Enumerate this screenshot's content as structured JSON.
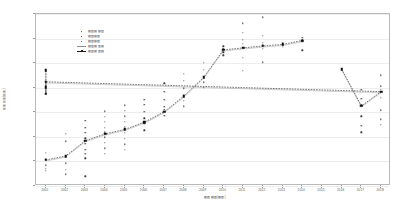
{
  "chart_data": {
    "type": "scatter",
    "title": "",
    "xlabel": "▤▥▤▥(▤▥)",
    "ylabel": "▤▥▤▥(▤▥)",
    "grid": true,
    "legend_position": "upper-left-inside",
    "ylim": [
      5000,
      40000
    ],
    "yticks": [
      5000,
      10000,
      15000,
      20000,
      25000,
      30000,
      35000,
      40000
    ],
    "ytick_labels": [
      "5000",
      "10000",
      "15000",
      "20000",
      "25000",
      "30000",
      "35000",
      "40000"
    ],
    "x": [
      2001,
      2002,
      2003,
      2004,
      2005,
      2006,
      2007,
      2008,
      2009,
      2010,
      2011,
      2012,
      2013,
      2014,
      2015,
      2016,
      2017,
      2018
    ],
    "xtick_labels": [
      "2001",
      "2002",
      "2003",
      "2004",
      "2005",
      "2006",
      "2007",
      "2008",
      "2009",
      "2010",
      "2011",
      "2012",
      "2013",
      "2014",
      "2015",
      "2016",
      "2017",
      "2018"
    ],
    "legend_entries": [
      {
        "label": "▤▥▤ ▤▥",
        "marker": "dot",
        "line": false,
        "color": "#3c3c3c"
      },
      {
        "label": "▤▥▤▥",
        "marker": "dot",
        "line": false,
        "color": "#3c3c3c"
      },
      {
        "label": "▤▥▤▥",
        "marker": "dot",
        "line": false,
        "color": "#3c3c3c"
      },
      {
        "label": "▤▥▤ ▥▤",
        "marker": "dot",
        "line": true,
        "color": "#8a8a8a"
      },
      {
        "label": "▤▥▤ ▥▤",
        "marker": "square",
        "line": true,
        "color": "#1d1d1d"
      }
    ],
    "series": [
      {
        "name": "trend-mean-segment-1",
        "type": "line+marker",
        "marker": "square",
        "color": "#1d1d1d",
        "x": [
          2001,
          2002,
          2003,
          2004,
          2005,
          2006,
          2007,
          2008,
          2009,
          2010,
          2011,
          2012,
          2013,
          2014
        ],
        "values": [
          10300,
          11100,
          14200,
          15600,
          16500,
          18000,
          20100,
          23300,
          27100,
          32700,
          33100,
          33500,
          33800,
          34600
        ]
      },
      {
        "name": "trend-mean-segment-2",
        "type": "line+marker",
        "marker": "square",
        "color": "#1d1d1d",
        "x": [
          2016,
          2017,
          2018,
          2019,
          2020,
          2021,
          2022
        ],
        "values": [
          28800,
          21300,
          24200,
          26200,
          23800,
          25100,
          28600
        ]
      }
    ],
    "scatter_columns": [
      {
        "x": 2001,
        "values": [
          11800,
          10400,
          9200,
          8500,
          8100
        ]
      },
      {
        "x": 2002,
        "values": [
          15600,
          14100,
          11200,
          9600,
          8300,
          7400
        ]
      },
      {
        "x": 2003,
        "values": [
          18300,
          16900,
          15800,
          14700,
          13600,
          12400,
          11500,
          10600,
          7000
        ]
      },
      {
        "x": 2004,
        "values": [
          20200,
          19100,
          18000,
          16800,
          15900,
          14900,
          13800,
          12700,
          11600
        ]
      },
      {
        "x": 2005,
        "values": [
          21400,
          20300,
          19200,
          18100,
          17000,
          15800,
          14600,
          13500,
          12300
        ]
      },
      {
        "x": 2006,
        "values": [
          22600,
          21500,
          20100,
          18800,
          17600,
          16300
        ]
      },
      {
        "x": 2007,
        "values": [
          25900,
          24100,
          22600,
          21100,
          20500,
          19300
        ]
      },
      {
        "x": 2008,
        "values": [
          27800,
          26400,
          24900,
          23500,
          22300,
          21200
        ]
      },
      {
        "x": 2009,
        "values": [
          30100,
          28600,
          27200,
          26100,
          25000
        ]
      },
      {
        "x": 2010,
        "values": [
          33400,
          32800,
          32200,
          31600
        ]
      },
      {
        "x": 2011,
        "values": [
          38100,
          36200,
          34800,
          33900,
          31100,
          28400
        ]
      },
      {
        "x": 2012,
        "values": [
          39300,
          35600,
          34200,
          33600,
          32900,
          30200
        ]
      },
      {
        "x": 2013,
        "values": [
          34100,
          33700,
          33300
        ]
      },
      {
        "x": 2014,
        "values": [
          35200,
          34700,
          34300,
          32600
        ]
      },
      {
        "x": 2016,
        "values": [
          28900,
          28700
        ]
      },
      {
        "x": 2017,
        "values": [
          24600,
          22800,
          21400,
          19200,
          17300,
          15900
        ]
      },
      {
        "x": 2018,
        "values": [
          27500,
          25300,
          24600,
          23900,
          22900,
          20400,
          18600,
          17400
        ]
      },
      {
        "x": 2019,
        "values": [
          30200,
          28100,
          26800,
          26300,
          25700,
          24900,
          22400,
          21100
        ]
      },
      {
        "x": 2020,
        "values": [
          27400,
          25600,
          23900,
          23500,
          22200
        ]
      },
      {
        "x": 2021,
        "values": [
          29100,
          27600,
          26400,
          25400,
          24800,
          24100,
          22700,
          21300
        ]
      },
      {
        "x": 2022,
        "values": [
          38600,
          35900,
          33100,
          31800,
          29400,
          28800,
          28200,
          27600,
          26900,
          25800
        ]
      }
    ]
  }
}
